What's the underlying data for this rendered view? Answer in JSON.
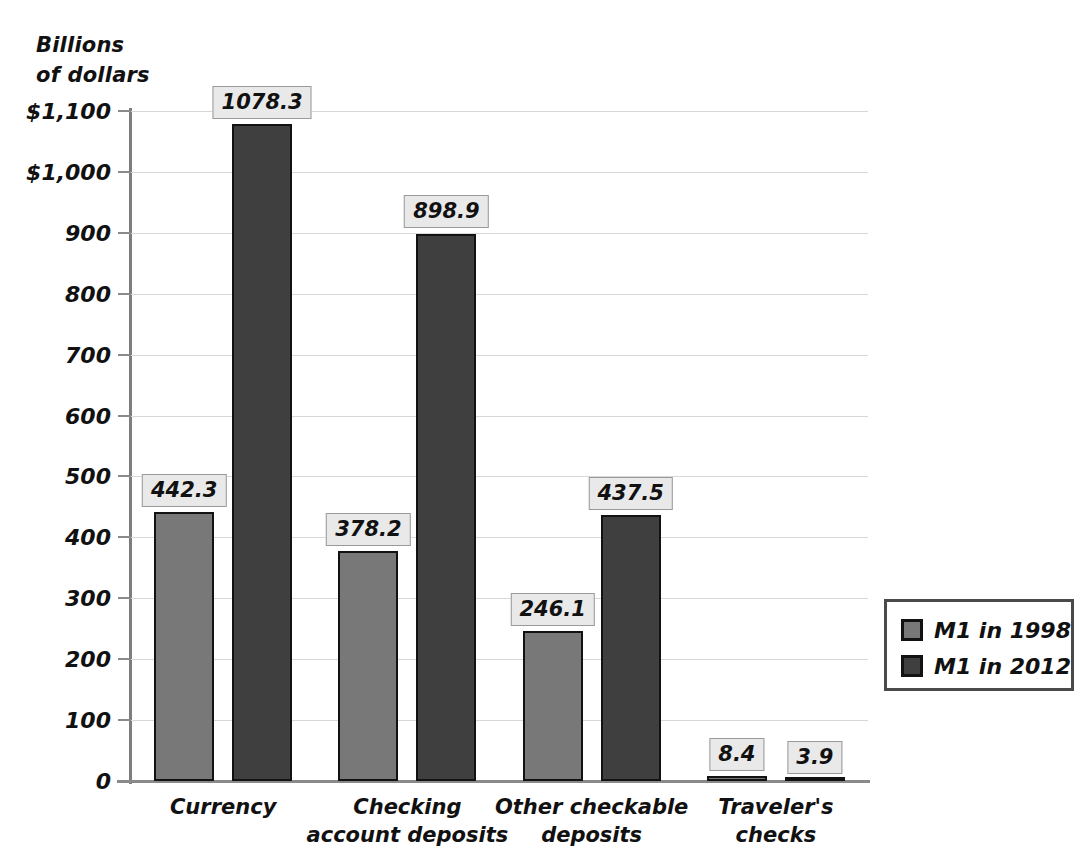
{
  "chart_data": {
    "type": "bar",
    "title": "",
    "ylabel": "Billions\nof dollars",
    "xlabel": "",
    "categories": [
      "Currency",
      "Checking\naccount deposits",
      "Other checkable\ndeposits",
      "Traveler's\nchecks"
    ],
    "series": [
      {
        "name": "M1 in 1998",
        "color": "#787878",
        "values": [
          442.3,
          378.2,
          246.1,
          8.4
        ]
      },
      {
        "name": "M1 in 2012",
        "color": "#3f3f3f",
        "values": [
          1078.3,
          898.9,
          437.5,
          3.9
        ]
      }
    ],
    "value_labels": [
      [
        "442.3",
        "378.2",
        "246.1",
        "8.4"
      ],
      [
        "1078.3",
        "898.9",
        "437.5",
        "3.9"
      ]
    ],
    "ylim": [
      0,
      1100
    ],
    "ytick_values": [
      1100,
      1000,
      900,
      800,
      700,
      600,
      500,
      400,
      300,
      200,
      100,
      0
    ],
    "ytick_labels": [
      "$1,100",
      "$1,000",
      "900",
      "800",
      "700",
      "600",
      "500",
      "400",
      "300",
      "200",
      "100",
      "0"
    ],
    "grid": true,
    "legend_position": "right"
  },
  "legend": {
    "entries": [
      {
        "label": "M1 in 1998"
      },
      {
        "label": "M1 in 2012"
      }
    ]
  }
}
